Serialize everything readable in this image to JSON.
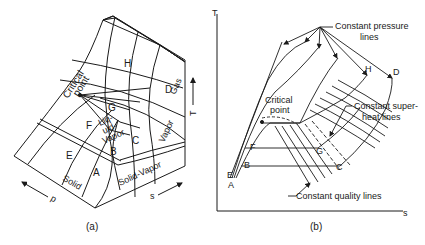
{
  "figure_a": {
    "caption": "(a)",
    "points": {
      "A": "A",
      "B": "B",
      "C": "C",
      "D": "D",
      "E": "E",
      "F": "F",
      "G": "G",
      "H": "H"
    },
    "regions": {
      "solid": "Solid",
      "solid_vapor": "Solid-Vapor",
      "liquid_vapor_1": "Liq-",
      "liquid_vapor_2": "uid-",
      "liquid_vapor_3": "Vapor",
      "vapor": "Vapor",
      "gas": "Gas"
    },
    "critical_point_1": "Critical",
    "critical_point_2": "point",
    "axes": {
      "p": "p",
      "s": "s",
      "T": "T"
    }
  },
  "figure_b": {
    "caption": "(b)",
    "axes": {
      "T": "T",
      "s": "s"
    },
    "points": {
      "A": "A",
      "B": "B",
      "C": "C",
      "D": "D",
      "E": "E",
      "F": "F",
      "G": "G",
      "H": "H"
    },
    "annotations": {
      "constant_pressure_1": "Constant pressure",
      "constant_pressure_2": "lines",
      "critical_point_1": "Critical",
      "critical_point_2": "point",
      "superheat_1": "Constant super-",
      "superheat_2": "heat lines",
      "quality": "Constant quality lines"
    }
  },
  "colors": {
    "ink": "#1a1a1a",
    "background": "#ffffff"
  }
}
